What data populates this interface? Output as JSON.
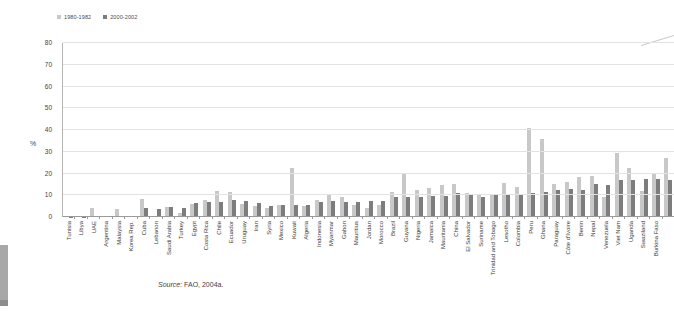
{
  "legend": {
    "items": [
      {
        "label": "1980-1982",
        "color": "#c8c8c8"
      },
      {
        "label": "2000-2002",
        "color": "#7d7d7d"
      }
    ]
  },
  "y_axis": {
    "label": "%",
    "ticks": [
      80,
      70,
      60,
      50,
      40,
      30,
      20,
      10,
      0
    ]
  },
  "source": {
    "label": "Source:",
    "text": "FAO, 2004a."
  },
  "chart_data": {
    "type": "bar",
    "title": "",
    "xlabel": "",
    "ylabel": "%",
    "ylim": [
      0,
      80
    ],
    "grid": "horizontal",
    "legend_position": "top-left",
    "categories": [
      "Tunisia",
      "Libya",
      "UAE",
      "Argentina",
      "Malaysia",
      "Korea Rep.",
      "Cuba",
      "Lebanon",
      "Saudi Arabia",
      "Turkey",
      "Egypt",
      "Costa Rica",
      "Chile",
      "Ecuador",
      "Uruguay",
      "Iran",
      "Syria",
      "Mexico",
      "Kuwait",
      "Algeria",
      "Indonesia",
      "Myanmar",
      "Gabon",
      "Mauritius",
      "Jordan",
      "Morocco",
      "Brazil",
      "Guyana",
      "Nigeria",
      "Jamaica",
      "Mauritania",
      "China",
      "El Salvador",
      "Suriname",
      "Trinidad and Tobago",
      "Lesotho",
      "Colombia",
      "Peru",
      "Ghana",
      "Paraguay",
      "Côte d'Ivoire",
      "Benin",
      "Nepal",
      "Venezuela",
      "Viet Nam",
      "Uganda",
      "Swaziland",
      "Burkina Faso",
      ""
    ],
    "series": [
      {
        "name": "1980-1982",
        "color": "#c8c8c8",
        "values": [
          0.3,
          0.4,
          4,
          0.4,
          3.5,
          0.5,
          8.5,
          0.5,
          4.5,
          2,
          6,
          8,
          12,
          11.5,
          6,
          5,
          4,
          5.5,
          22.5,
          5,
          8,
          10,
          9,
          5.5,
          4,
          5.5,
          11.5,
          20,
          12.5,
          13.5,
          14.5,
          15,
          11,
          10.5,
          10.5,
          15.5,
          14,
          41,
          36,
          15,
          16,
          18.5,
          19,
          9,
          29.5,
          22.5,
          12,
          20,
          27
        ]
      },
      {
        "name": "2000-2002",
        "color": "#7d7d7d",
        "values": [
          0.2,
          0.2,
          0.3,
          0.3,
          0.3,
          0.3,
          4,
          3.5,
          4.5,
          4,
          6.5,
          7,
          7,
          8,
          7.5,
          6.5,
          5,
          5.5,
          5.5,
          5.5,
          7,
          7.5,
          7,
          7,
          7.5,
          7.5,
          9,
          9,
          9,
          9.5,
          9.5,
          11,
          10,
          9,
          10,
          10,
          10.5,
          11,
          11.5,
          12.5,
          13,
          12.5,
          15,
          14.5,
          17,
          17,
          17.5,
          17.5,
          17
        ]
      }
    ]
  }
}
